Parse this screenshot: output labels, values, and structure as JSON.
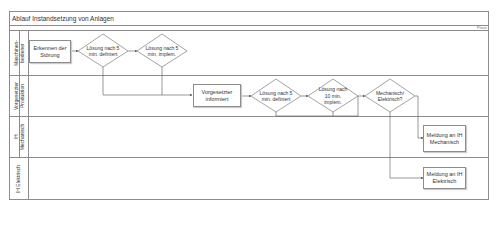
{
  "title": "Ablauf Instandsetzung von Anlagen",
  "phase_label": "Phase",
  "lanes": [
    {
      "label_line1": "Maschinen-",
      "label_line2": "bediener"
    },
    {
      "label_line1": "Vorgesetzter",
      "label_line2": "Produktion"
    },
    {
      "label_line1": "IH",
      "label_line2": "Mechanisch"
    },
    {
      "label_line1": "IH Elektrisch",
      "label_line2": ""
    }
  ],
  "nodes": {
    "erkennen": "Erkennen der Störung",
    "loesung1_def": "Lösung nach 5 min. definiert",
    "loesung1_impl": "Lösung nach 5 min. implem.",
    "vorgesetzter": "Vorgesetzter informiert",
    "loesung2_def": "Lösung nach 5 min. definiert",
    "loesung2_impl": "Lösung nach 10 min. implem.",
    "mech_elek": "Mechanisch/ Elektrisch?",
    "meldung_mech": "Meldung an IH Mechanisch",
    "meldung_elek": "Meldung an IH Elektrisch"
  },
  "colors": {
    "line": "#8c8c8c",
    "text": "#333333"
  }
}
